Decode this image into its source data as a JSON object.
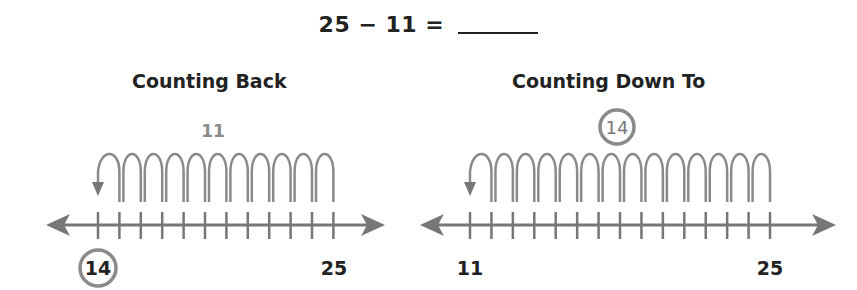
{
  "equation": {
    "left": "25",
    "operator": "−",
    "right": "11",
    "equals": "=",
    "answer_blank": ""
  },
  "panels": [
    {
      "title": "Counting Back",
      "jump_label": "11",
      "jump_label_circled": false,
      "start": 25,
      "end": 14,
      "jumps": 11,
      "tick_range": [
        14,
        25
      ],
      "left_label": "14",
      "left_label_circled": true,
      "right_label": "25"
    },
    {
      "title": "Counting Down To",
      "jump_label": "14",
      "jump_label_circled": true,
      "start": 25,
      "end": 11,
      "jumps": 14,
      "tick_range": [
        11,
        25
      ],
      "left_label": "11",
      "left_label_circled": false,
      "right_label": "25"
    }
  ],
  "colors": {
    "line": "#777777",
    "text": "#222222",
    "accent_gray": "#8a8a8a"
  }
}
